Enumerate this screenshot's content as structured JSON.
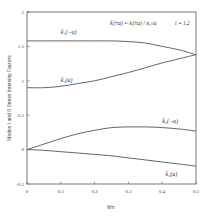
{
  "chart_data": {
    "type": "line",
    "title": "",
    "xlabel": "θ/π",
    "ylabel": "Modes I and II Stress Intensity Factors",
    "xlim": [
      0,
      0.5
    ],
    "ylim": [
      -0.5,
      2
    ],
    "x_ticks": [
      "0",
      "0.1",
      "0.2",
      "0.3",
      "0.4",
      "0.5"
    ],
    "y_ticks": [
      "-0.5",
      "0",
      "0.5",
      "1",
      "1.5",
      "2"
    ],
    "grid": false,
    "annotation": {
      "formula": "k̃ᵢ(±a) = kᵢ(±a) / σ₀√a",
      "index_note": "i = 1,2"
    },
    "x": [
      0,
      0.05,
      0.1,
      0.15,
      0.2,
      0.25,
      0.3,
      0.35,
      0.4,
      0.45,
      0.5
    ],
    "series": [
      {
        "name": "k̃₁(−a)",
        "label_pos": [
          0.1,
          1.68
        ],
        "values": [
          1.58,
          1.58,
          1.58,
          1.58,
          1.58,
          1.58,
          1.57,
          1.55,
          1.5,
          1.45,
          1.38
        ]
      },
      {
        "name": "k̃₁(a)",
        "label_pos": [
          0.1,
          0.98
        ],
        "values": [
          0.9,
          0.9,
          0.92,
          0.96,
          1.0,
          1.06,
          1.12,
          1.19,
          1.26,
          1.32,
          1.38
        ]
      },
      {
        "name": "k̃₂(−a)",
        "label_pos": [
          0.4,
          0.38
        ],
        "values": [
          0.0,
          0.08,
          0.16,
          0.23,
          0.28,
          0.32,
          0.33,
          0.33,
          0.32,
          0.3,
          0.27
        ]
      },
      {
        "name": "k̃₂(a)",
        "label_pos": [
          0.41,
          -0.38
        ],
        "values": [
          0.0,
          -0.01,
          -0.03,
          -0.05,
          -0.07,
          -0.09,
          -0.12,
          -0.15,
          -0.18,
          -0.21,
          -0.24
        ]
      }
    ]
  }
}
